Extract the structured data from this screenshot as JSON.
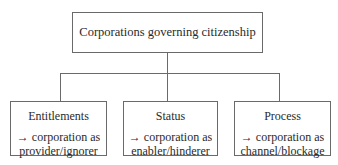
{
  "diagram": {
    "root": {
      "label": "Corporations governing citizenship"
    },
    "children": [
      {
        "title": "Entitlements",
        "arrow": "→",
        "line1": "corporation as",
        "line2": "provider/ignorer"
      },
      {
        "title": "Status",
        "arrow": "→",
        "line1": "corporation as",
        "line2": "enabler/hinderer"
      },
      {
        "title": "Process",
        "arrow": "→",
        "line1": "corporation as",
        "line2": "channel/blockage"
      }
    ],
    "colors": {
      "line": "#6a6a6a",
      "text": "#2a2a2a",
      "background": "#ffffff"
    }
  }
}
